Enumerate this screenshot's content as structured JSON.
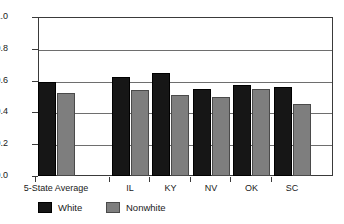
{
  "chart_data": {
    "type": "bar",
    "title": "",
    "subtitle": "",
    "xlabel": "",
    "ylabel": "",
    "ylim": [
      0.0,
      1.0
    ],
    "ytick_labels": [
      "0.0",
      "0.2",
      "0.4",
      "0.6",
      "0.8",
      "1.0"
    ],
    "ytick_values": [
      0.0,
      0.2,
      0.4,
      0.6,
      0.8,
      1.0
    ],
    "grid": "horizontal",
    "legend_position": "bottom-left",
    "categories": [
      "5-State Average",
      "IL",
      "KY",
      "NV",
      "OK",
      "SC"
    ],
    "series": [
      {
        "name": "White",
        "color": "#161616",
        "values": [
          0.59,
          0.62,
          0.65,
          0.55,
          0.57,
          0.56
        ]
      },
      {
        "name": "Nonwhite",
        "color": "#7e7e7e",
        "values": [
          0.52,
          0.54,
          0.51,
          0.5,
          0.545,
          0.45
        ]
      }
    ]
  },
  "legend": {
    "entries": [
      {
        "label": "White",
        "swatch": "black-square-swatch"
      },
      {
        "label": "Nonwhite",
        "swatch": "gray-square-swatch"
      }
    ]
  },
  "colors": {
    "background": "#ffffff",
    "axis": "#3a3a3a",
    "gridline": "#6e6e6e",
    "white_series": "#161616",
    "nonwhite_series": "#7e7e7e",
    "text": "#1a1a1a"
  }
}
